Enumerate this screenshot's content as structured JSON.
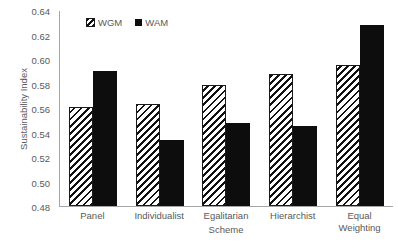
{
  "chart_data": {
    "type": "bar",
    "title": "",
    "xlabel": "Scheme",
    "ylabel": "Sustainability Index",
    "ylim": [
      0.48,
      0.64
    ],
    "ytick_labels": [
      "0.64",
      "0.62",
      "0.60",
      "0.58",
      "0.56",
      "0.54",
      "0.52",
      "0.50",
      "0.48"
    ],
    "ytick_values": [
      0.64,
      0.62,
      0.6,
      0.58,
      0.56,
      0.54,
      0.52,
      0.5,
      0.48
    ],
    "grid": false,
    "legend_position": "top-left-inside",
    "categories": [
      "Panel",
      "Individualist",
      "Egalitarian",
      "Hierarchist",
      "Equal Weighting"
    ],
    "series": [
      {
        "name": "WGM",
        "marker": "hatched-square",
        "color": "#ffffff",
        "pattern": "diagonal-hatch",
        "values": [
          0.5605,
          0.563,
          0.579,
          0.5875,
          0.595
        ]
      },
      {
        "name": "WAM",
        "marker": "solid-square",
        "color": "#0d0d0d",
        "pattern": "solid",
        "values": [
          0.59,
          0.5335,
          0.5475,
          0.5455,
          0.6275
        ]
      }
    ]
  },
  "legend": {
    "items": [
      {
        "label": "WGM",
        "swatch": "hatched-square-swatch"
      },
      {
        "label": "WAM",
        "swatch": "solid-square-swatch"
      }
    ]
  },
  "axes": {
    "y_title": "Sustainability Index",
    "x_title": "Scheme"
  }
}
